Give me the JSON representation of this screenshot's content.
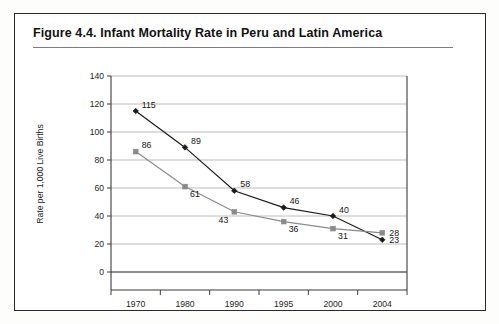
{
  "figure": {
    "title": "Figure 4.4.  Infant Mortality Rate in Peru and Latin America"
  },
  "chart_data": {
    "type": "line",
    "title": "Infant Mortality Rate in Peru and Latin America",
    "xlabel": "",
    "ylabel": "Rate per 1,000 Live Births",
    "categories": [
      "1970",
      "1980",
      "1990",
      "1995",
      "2000",
      "2004"
    ],
    "ylim": [
      0,
      140
    ],
    "ytick_values": [
      "0",
      "20",
      "40",
      "60",
      "80",
      "100",
      "120",
      "140"
    ],
    "grid": true,
    "legend_position": "bottom-center",
    "series": [
      {
        "name": "Peru",
        "color": "#1a1a1a",
        "marker": "diamond",
        "values": [
          115,
          89,
          58,
          46,
          40,
          23
        ],
        "labels": [
          "115",
          "89",
          "58",
          "46",
          "40",
          "23"
        ]
      },
      {
        "name": "Latin America",
        "color": "#8a8a8a",
        "marker": "square",
        "values": [
          86,
          61,
          43,
          36,
          31,
          28
        ],
        "labels": [
          "86",
          "61",
          "43",
          "36",
          "31",
          "28"
        ]
      }
    ]
  }
}
